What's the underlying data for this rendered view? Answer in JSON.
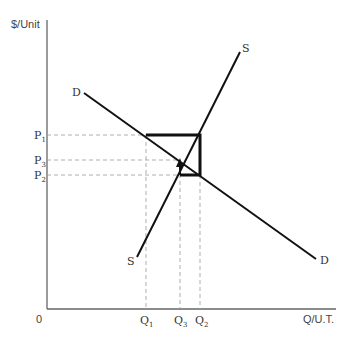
{
  "diagram": {
    "y_axis_label": "$/Unit",
    "x_axis_label": "Q/U.T.",
    "origin_label": "0",
    "curves": {
      "demand": {
        "label_start": "D",
        "label_end": "D"
      },
      "supply": {
        "label_start": "S",
        "label_end": "S"
      }
    },
    "price_labels": [
      {
        "main": "P",
        "sub": "1"
      },
      {
        "main": "P",
        "sub": "3"
      },
      {
        "main": "P",
        "sub": "2"
      }
    ],
    "quantity_labels": [
      {
        "main": "Q",
        "sub": "1"
      },
      {
        "main": "Q",
        "sub": "3"
      },
      {
        "main": "Q",
        "sub": "2"
      }
    ],
    "colors": {
      "line": "#111111",
      "axis": "#555555",
      "guide": "#999999"
    }
  }
}
